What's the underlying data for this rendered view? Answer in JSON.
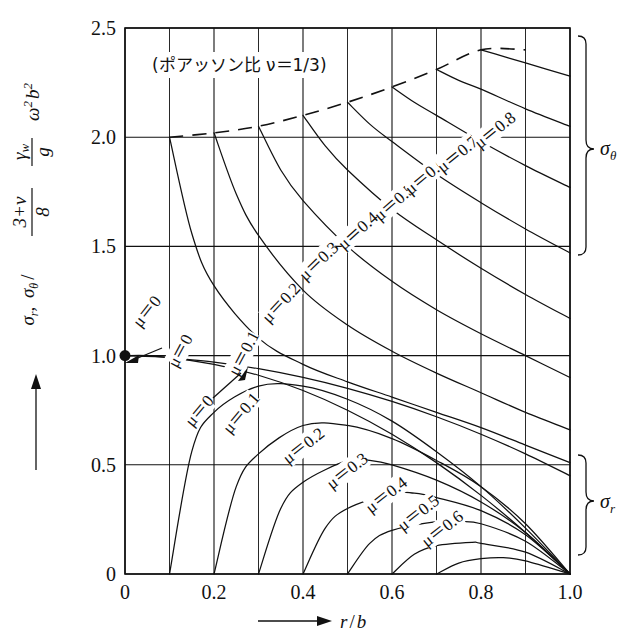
{
  "figure": {
    "annotation_title": "(ポアッソン比 ν＝1/3)",
    "ylabel": "σr, σθ ⁄ (3+ν)/8 · γw/g · ω²b²",
    "xlabel": "r / b",
    "brace_upper_label": "σθ",
    "brace_lower_label": "σr"
  },
  "axes": {
    "x_ticks": [
      "0",
      "0.2",
      "0.4",
      "0.6",
      "0.8",
      "1.0"
    ],
    "x_tick_values": [
      0,
      0.2,
      0.4,
      0.6,
      0.8,
      1.0
    ],
    "y_ticks": [
      "0",
      "0.5",
      "1.0",
      "1.5",
      "2.0",
      "2.5"
    ],
    "y_tick_values": [
      0,
      0.5,
      1.0,
      1.5,
      2.0,
      2.5
    ],
    "x_minor_step": 0.1,
    "y_minor_step": 0.5
  },
  "labels": {
    "sigma_theta": [
      {
        "text": "μ＝0",
        "x": 0.125,
        "y": 1.02,
        "rot": -62
      },
      {
        "text": "μ＝0.1",
        "x": 0.268,
        "y": 1.01,
        "rot": -62
      },
      {
        "text": "μ＝0.2",
        "x": 0.352,
        "y": 1.24,
        "rot": -47
      },
      {
        "text": "μ＝0.3",
        "x": 0.436,
        "y": 1.43,
        "rot": -44
      },
      {
        "text": "μ＝0.4",
        "x": 0.524,
        "y": 1.57,
        "rot": -42
      },
      {
        "text": "μ＝0.5",
        "x": 0.606,
        "y": 1.7,
        "rot": -41
      },
      {
        "text": "μ＝0.6",
        "x": 0.676,
        "y": 1.82,
        "rot": -40
      },
      {
        "text": "μ＝0.7",
        "x": 0.748,
        "y": 1.92,
        "rot": -39
      },
      {
        "text": "μ＝0.8",
        "x": 0.832,
        "y": 2.03,
        "rot": -39
      }
    ],
    "sigma_r": [
      {
        "text": "μ＝0",
        "x": 0.168,
        "y": 0.745,
        "rot": -50
      },
      {
        "text": "μ＝0.1",
        "x": 0.262,
        "y": 0.735,
        "rot": -50
      },
      {
        "text": "μ＝0.2",
        "x": 0.402,
        "y": 0.585,
        "rot": -38
      },
      {
        "text": "μ＝0.3",
        "x": 0.5,
        "y": 0.47,
        "rot": -38
      },
      {
        "text": "μ＝0.4",
        "x": 0.588,
        "y": 0.36,
        "rot": -38
      },
      {
        "text": "μ＝0.5",
        "x": 0.66,
        "y": 0.277,
        "rot": -38
      },
      {
        "text": "μ＝0.6",
        "x": 0.714,
        "y": 0.205,
        "rot": -38
      }
    ],
    "origin_callout": {
      "text": "μ＝0",
      "x": 0.05,
      "y": 1.2,
      "rot": -52
    }
  },
  "chart_data": {
    "type": "line",
    "title": "(ポアッソン比 ν＝1/3)",
    "xlabel": "r / b",
    "ylabel": "σr, σθ / ((3+ν)/8)(γw/g)ω²b²",
    "xlim": [
      0,
      1.0
    ],
    "ylim": [
      0,
      2.5
    ],
    "grid": true,
    "legend": "inline curve labels",
    "note": "Rotating annular/solid disk stresses; μ = inner-to-outer radius ratio a/b. Upper family = hoop stress σθ, lower family = radial stress σr. Dashed curve is the locus of σθ maxima.",
    "series": [
      {
        "name": "σθ, μ=0",
        "group": "sigma_theta",
        "mu": 0.0,
        "x": [
          0.0,
          0.05,
          0.1,
          0.2,
          0.3,
          0.4,
          0.5,
          0.6,
          0.7,
          0.8,
          0.9,
          1.0
        ],
        "y": [
          1.0,
          1.0,
          0.99,
          0.97,
          0.94,
          0.9,
          0.85,
          0.79,
          0.72,
          0.64,
          0.55,
          0.45
        ]
      },
      {
        "name": "σθ, μ=0.1",
        "group": "sigma_theta",
        "mu": 0.1,
        "x": [
          0.1,
          0.15,
          0.2,
          0.3,
          0.4,
          0.5,
          0.6,
          0.7,
          0.8,
          0.9,
          1.0
        ],
        "y": [
          2.0,
          1.56,
          1.32,
          1.08,
          0.96,
          0.88,
          0.81,
          0.74,
          0.67,
          0.59,
          0.51
        ]
      },
      {
        "name": "σθ, μ=0.2",
        "group": "sigma_theta",
        "mu": 0.2,
        "x": [
          0.2,
          0.25,
          0.3,
          0.4,
          0.5,
          0.6,
          0.7,
          0.8,
          0.9,
          1.0
        ],
        "y": [
          2.02,
          1.74,
          1.55,
          1.3,
          1.14,
          1.02,
          0.92,
          0.83,
          0.74,
          0.66
        ]
      },
      {
        "name": "σθ, μ=0.3",
        "group": "sigma_theta",
        "mu": 0.3,
        "x": [
          0.3,
          0.35,
          0.4,
          0.5,
          0.6,
          0.7,
          0.8,
          0.9,
          1.0
        ],
        "y": [
          2.05,
          1.85,
          1.71,
          1.5,
          1.34,
          1.21,
          1.1,
          1.0,
          0.9
        ]
      },
      {
        "name": "σθ, μ=0.4",
        "group": "sigma_theta",
        "mu": 0.4,
        "x": [
          0.4,
          0.45,
          0.5,
          0.6,
          0.7,
          0.8,
          0.9,
          1.0
        ],
        "y": [
          2.1,
          1.96,
          1.85,
          1.67,
          1.53,
          1.4,
          1.28,
          1.17
        ]
      },
      {
        "name": "σθ, μ=0.5",
        "group": "sigma_theta",
        "mu": 0.5,
        "x": [
          0.5,
          0.55,
          0.6,
          0.7,
          0.8,
          0.9,
          1.0
        ],
        "y": [
          2.16,
          2.06,
          1.98,
          1.83,
          1.7,
          1.58,
          1.47
        ]
      },
      {
        "name": "σθ, μ=0.6",
        "group": "sigma_theta",
        "mu": 0.6,
        "x": [
          0.6,
          0.65,
          0.7,
          0.8,
          0.9,
          1.0
        ],
        "y": [
          2.23,
          2.16,
          2.1,
          1.98,
          1.87,
          1.77
        ]
      },
      {
        "name": "σθ, μ=0.7",
        "group": "sigma_theta",
        "mu": 0.7,
        "x": [
          0.7,
          0.75,
          0.8,
          0.9,
          1.0
        ],
        "y": [
          2.31,
          2.26,
          2.22,
          2.13,
          2.05
        ]
      },
      {
        "name": "σθ, μ=0.8",
        "group": "sigma_theta",
        "mu": 0.8,
        "x": [
          0.8,
          0.85,
          0.9,
          1.0
        ],
        "y": [
          2.4,
          2.37,
          2.34,
          2.28
        ]
      },
      {
        "name": "σr, μ=0",
        "group": "sigma_r",
        "mu": 0.0,
        "x": [
          0.0,
          0.1,
          0.2,
          0.3,
          0.4,
          0.5,
          0.6,
          0.7,
          0.8,
          0.9,
          1.0
        ],
        "y": [
          1.0,
          0.99,
          0.96,
          0.91,
          0.84,
          0.75,
          0.64,
          0.51,
          0.36,
          0.19,
          0.0
        ]
      },
      {
        "name": "σr, μ=0.1",
        "group": "sigma_r",
        "mu": 0.1,
        "x": [
          0.1,
          0.15,
          0.2,
          0.3,
          0.4,
          0.5,
          0.6,
          0.7,
          0.8,
          0.9,
          1.0
        ],
        "y": [
          0.0,
          0.56,
          0.74,
          0.86,
          0.86,
          0.8,
          0.7,
          0.56,
          0.4,
          0.21,
          0.0
        ]
      },
      {
        "name": "σr, μ=0.2",
        "group": "sigma_r",
        "mu": 0.2,
        "x": [
          0.2,
          0.25,
          0.3,
          0.4,
          0.5,
          0.6,
          0.7,
          0.8,
          0.9,
          1.0
        ],
        "y": [
          0.0,
          0.4,
          0.55,
          0.68,
          0.68,
          0.62,
          0.52,
          0.4,
          0.23,
          0.0
        ]
      },
      {
        "name": "σr, μ=0.3",
        "group": "sigma_r",
        "mu": 0.3,
        "x": [
          0.3,
          0.35,
          0.4,
          0.5,
          0.55,
          0.6,
          0.7,
          0.8,
          0.9,
          1.0
        ],
        "y": [
          0.0,
          0.3,
          0.42,
          0.52,
          0.52,
          0.5,
          0.43,
          0.33,
          0.19,
          0.0
        ]
      },
      {
        "name": "σr, μ=0.4",
        "group": "sigma_r",
        "mu": 0.4,
        "x": [
          0.4,
          0.45,
          0.5,
          0.6,
          0.65,
          0.7,
          0.8,
          0.9,
          1.0
        ],
        "y": [
          0.0,
          0.21,
          0.3,
          0.37,
          0.37,
          0.35,
          0.29,
          0.18,
          0.0
        ]
      },
      {
        "name": "σr, μ=0.5",
        "group": "sigma_r",
        "mu": 0.5,
        "x": [
          0.5,
          0.55,
          0.6,
          0.7,
          0.75,
          0.8,
          0.9,
          1.0
        ],
        "y": [
          0.0,
          0.14,
          0.2,
          0.24,
          0.24,
          0.23,
          0.15,
          0.0
        ]
      },
      {
        "name": "σr, μ=0.6",
        "group": "sigma_r",
        "mu": 0.6,
        "x": [
          0.6,
          0.65,
          0.7,
          0.78,
          0.8,
          0.9,
          1.0
        ],
        "y": [
          0.0,
          0.09,
          0.13,
          0.145,
          0.14,
          0.1,
          0.0
        ]
      },
      {
        "name": "σr, μ=0.7",
        "group": "sigma_r",
        "mu": 0.7,
        "x": [
          0.7,
          0.75,
          0.8,
          0.85,
          0.9,
          1.0
        ],
        "y": [
          0.0,
          0.05,
          0.07,
          0.075,
          0.06,
          0.0
        ]
      },
      {
        "name": "σθ-max envelope",
        "group": "envelope",
        "dashed": true,
        "x": [
          0.1,
          0.2,
          0.3,
          0.4,
          0.5,
          0.6,
          0.7,
          0.8,
          0.9
        ],
        "y": [
          2.0,
          2.02,
          2.05,
          2.1,
          2.16,
          2.23,
          2.31,
          2.4,
          2.4
        ]
      }
    ],
    "markers": [
      {
        "name": "origin-dot",
        "x": 0.0,
        "y": 1.0
      }
    ]
  }
}
